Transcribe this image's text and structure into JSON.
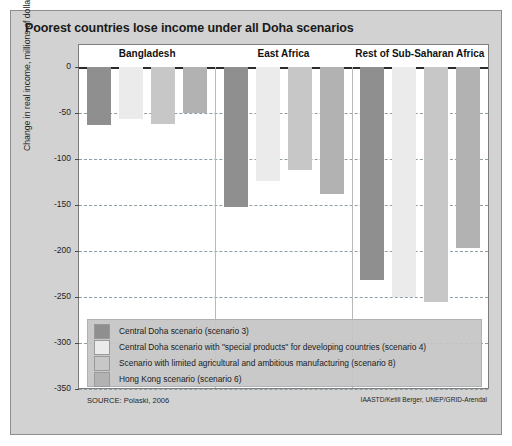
{
  "figure": {
    "title": "Poorest countries lose income under all Doha scenarios",
    "source": "SOURCE: Polaski, 2006",
    "credit": "IAASTD/Ketill Berger, UNEP/GRID-Arendal"
  },
  "legend": {
    "items": [
      {
        "label": "Central Doha scenario (scenario 3)",
        "color": "#8f8f8f"
      },
      {
        "label": "Central Doha scenario with \"special products\" for developing countries (scenario 4)",
        "color": "#ebebeb"
      },
      {
        "label": "Scenario with limited agricultural and ambitious manufacturing (scenario 8)",
        "color": "#c7c7c7"
      },
      {
        "label": "Hong Kong scenario (scenario 6)",
        "color": "#b2b2b2"
      }
    ]
  },
  "chart_data": {
    "type": "bar",
    "title": "Poorest countries lose income under all Doha scenarios",
    "xlabel": "",
    "ylabel": "Change in real income, millions of dollars",
    "ylim": [
      -350,
      0
    ],
    "yticks": [
      0,
      -50,
      -100,
      -150,
      -200,
      -250,
      -300,
      -350
    ],
    "ytick_labels": [
      "0",
      "-50",
      "-100",
      "-150",
      "-200",
      "-250",
      "-300",
      "-350"
    ],
    "grid": true,
    "legend_position": "inside-bottom-left",
    "categories": [
      "Bangladesh",
      "East Africa",
      "Rest of Sub-Saharan Africa"
    ],
    "series": [
      {
        "name": "Central Doha scenario (scenario 3)",
        "color": "#8f8f8f",
        "values": [
          -63,
          -152,
          -232
        ]
      },
      {
        "name": "Central Doha scenario with \"special products\" for developing countries (scenario 4)",
        "color": "#ebebeb",
        "values": [
          -57,
          -124,
          -250
        ]
      },
      {
        "name": "Scenario with limited agricultural and ambitious manufacturing (scenario 8)",
        "color": "#c7c7c7",
        "values": [
          -62,
          -112,
          -255
        ]
      },
      {
        "name": "Hong Kong scenario (scenario 6)",
        "color": "#b2b2b2",
        "values": [
          -50,
          -138,
          -197
        ]
      }
    ]
  }
}
